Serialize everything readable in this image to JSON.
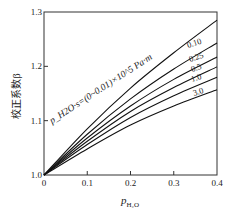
{
  "chart_data": {
    "type": "line",
    "title": "",
    "xlabel": "p_H2O",
    "xlabel_main": "p",
    "xlabel_sub": "H₂O",
    "ylabel": "校正系数β",
    "xlim": [
      0,
      0.4
    ],
    "ylim": [
      1.0,
      1.3
    ],
    "x_ticks": [
      0,
      0.1,
      0.2,
      0.3,
      0.4
    ],
    "x_tick_labels": [
      "0",
      "0.1",
      "0.2",
      "0.3",
      "0.4"
    ],
    "y_ticks": [
      1.0,
      1.1,
      1.2,
      1.3
    ],
    "y_tick_labels": [
      "1.0",
      "1.1",
      "1.2",
      "1.3"
    ],
    "grid": false,
    "legend": "none (curves labeled inline)",
    "curve_parameter": "p_H2O·s (×10^5 Pa·m)",
    "annotation": "p_H2O·s=(0~0.01)×10^5 Pa·m",
    "x": [
      0,
      0.1,
      0.2,
      0.3,
      0.4
    ],
    "series": [
      {
        "name": "(0~0.01)",
        "label": "",
        "values": [
          1.0,
          1.085,
          1.16,
          1.225,
          1.285
        ]
      },
      {
        "name": "0.10",
        "label": "0.10",
        "values": [
          1.0,
          1.075,
          1.14,
          1.195,
          1.243
        ]
      },
      {
        "name": "0.25",
        "label": "0.25",
        "values": [
          1.0,
          1.068,
          1.127,
          1.176,
          1.217
        ]
      },
      {
        "name": "0.5",
        "label": "0.5",
        "values": [
          1.0,
          1.062,
          1.117,
          1.161,
          1.199
        ]
      },
      {
        "name": "1.0",
        "label": "1.0",
        "values": [
          1.0,
          1.056,
          1.106,
          1.146,
          1.18
        ]
      },
      {
        "name": "3.0",
        "label": "3.0",
        "values": [
          1.0,
          1.048,
          1.092,
          1.127,
          1.157
        ]
      }
    ]
  }
}
